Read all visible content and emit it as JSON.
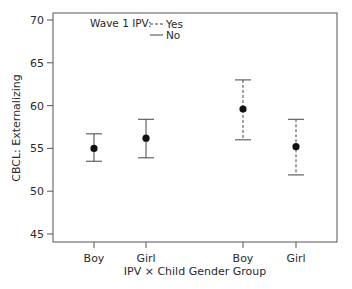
{
  "chart_data": {
    "type": "scatter",
    "subtype": "point-with-error-bars",
    "title": "",
    "xlabel": "IPV × Child Gender Group",
    "ylabel": "CBCL: Externalizing",
    "ylim": [
      45,
      70
    ],
    "yticks": [
      45,
      50,
      55,
      60,
      65,
      70
    ],
    "grid": false,
    "legend": {
      "title": "Wave 1 IPV:",
      "position": "top-left inside",
      "entries": [
        {
          "label": "Yes",
          "line_style": "dashed"
        },
        {
          "label": "No",
          "line_style": "solid"
        }
      ]
    },
    "categories": [
      "Boy",
      "Girl",
      "Boy",
      "Girl"
    ],
    "series": [
      {
        "name": "No",
        "line_style": "solid",
        "points": [
          {
            "category": "Boy",
            "mean": 55.0,
            "lower": 53.5,
            "upper": 56.7
          },
          {
            "category": "Girl",
            "mean": 56.2,
            "lower": 53.9,
            "upper": 58.4
          }
        ]
      },
      {
        "name": "Yes",
        "line_style": "dashed",
        "points": [
          {
            "category": "Boy",
            "mean": 59.6,
            "lower": 56.0,
            "upper": 63.0
          },
          {
            "category": "Girl",
            "mean": 55.2,
            "lower": 51.9,
            "upper": 58.4
          }
        ]
      }
    ]
  }
}
